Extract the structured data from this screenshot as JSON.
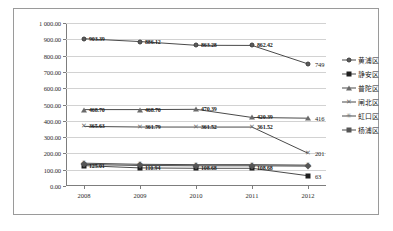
{
  "chart_data": {
    "type": "line",
    "title": "",
    "xlabel": "",
    "ylabel": "",
    "categories": [
      "2008",
      "2009",
      "2010",
      "2011",
      "2012"
    ],
    "ylim": [
      0,
      1000
    ],
    "ytick_labels": [
      "0.00",
      "100.00",
      "200.00",
      "300.00",
      "400.00",
      "500.00",
      "600.00",
      "700.00",
      "800.00",
      "900.00",
      "1 000.00"
    ],
    "ytick_values": [
      0,
      100,
      200,
      300,
      400,
      500,
      600,
      700,
      800,
      900,
      1000
    ],
    "grid": true,
    "legend_position": "right",
    "series": [
      {
        "name": "黄浦区",
        "marker": "circle",
        "values": [
          903.39,
          886.12,
          863.28,
          862.42,
          749
        ],
        "labels": [
          "903.39",
          "886.12",
          "863.28",
          "862.42",
          "749"
        ]
      },
      {
        "name": "静安区",
        "marker": "square",
        "values": [
          125.01,
          110.94,
          108.68,
          108.68,
          63
        ],
        "labels": [
          "125.01",
          "110.94",
          "108.68",
          "108.68",
          "63"
        ]
      },
      {
        "name": "普陀区",
        "marker": "triangle",
        "values": [
          468.7,
          468.7,
          470.39,
          420.39,
          416
        ],
        "labels": [
          "468.70",
          "468.70",
          "470.39",
          "420.39",
          "416"
        ]
      },
      {
        "name": "闸北区",
        "marker": "x",
        "values": [
          365.63,
          361.79,
          361.52,
          361.52,
          201
        ],
        "labels": [
          "365.63",
          "361.79",
          "361.52",
          "361.52",
          "201"
        ]
      },
      {
        "name": "虹口区",
        "marker": "star",
        "values": [
          140.0,
          133.0,
          131.0,
          131.0,
          128.0
        ],
        "labels": [
          "",
          "",
          "",
          "",
          ""
        ]
      },
      {
        "name": "杨浦区",
        "marker": "diamond",
        "values": [
          132.0,
          126.0,
          124.0,
          124.0,
          122.0
        ],
        "labels": [
          "",
          "",
          "",
          "",
          ""
        ]
      }
    ]
  },
  "legend": {
    "items": [
      {
        "label": "黄浦区"
      },
      {
        "label": "静安区"
      },
      {
        "label": "普陀区"
      },
      {
        "label": "闸北区"
      },
      {
        "label": "虹口区"
      },
      {
        "label": "杨浦区"
      }
    ]
  }
}
